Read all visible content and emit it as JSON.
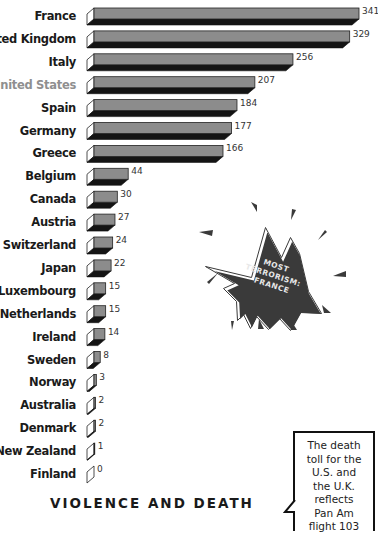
{
  "chart_data": {
    "type": "bar",
    "orientation": "horizontal",
    "title": "VIOLENCE AND DEATH",
    "xlabel": "",
    "ylabel": "",
    "grid": false,
    "legend": null,
    "categories": [
      "France",
      "United Kingdom",
      "Italy",
      "United States",
      "Spain",
      "Germany",
      "Greece",
      "Belgium",
      "Canada",
      "Austria",
      "Switzerland",
      "Japan",
      "Luxembourg",
      "Netherlands",
      "Ireland",
      "Sweden",
      "Norway",
      "Australia",
      "Denmark",
      "New Zealand",
      "Finland"
    ],
    "values": [
      341,
      329,
      256,
      207,
      184,
      177,
      166,
      44,
      30,
      27,
      24,
      22,
      15,
      15,
      14,
      8,
      3,
      2,
      2,
      1,
      0
    ],
    "highlighted_category": "United States",
    "xlim": [
      0,
      341
    ],
    "annotations": [
      {
        "type": "starburst",
        "lines": [
          "MOST",
          "TERRORISM:",
          "FRANCE"
        ]
      },
      {
        "type": "callout",
        "lines": [
          "The death",
          "toll for the",
          "U.S. and",
          "the U.K.",
          "reflects",
          "Pan Am",
          "flight 103"
        ]
      }
    ]
  },
  "colors": {
    "bar_face": "#8c8c8c",
    "bar_bottom": "#141414",
    "bar_end": "#ffffff",
    "label": "#1a1a1a",
    "highlight_label": "#8f8f8f",
    "burst_fill": "#3a3a3a"
  },
  "title": "VIOLENCE AND DEATH",
  "burst": {
    "lines": [
      "MOST",
      "TERRORISM:",
      "FRANCE"
    ]
  },
  "callout": {
    "lines": [
      "The death",
      "toll for the",
      "U.S. and",
      "the U.K.",
      "reflects",
      "Pan Am",
      "flight 103"
    ]
  }
}
